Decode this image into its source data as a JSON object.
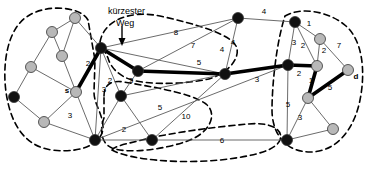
{
  "diagram": {
    "annotation": {
      "line1": "kürzester",
      "line2": "Weg",
      "x": 108,
      "y": 14
    },
    "colors": {
      "node_dark": "#111111",
      "node_light": "#b8b8b8",
      "edge": "#5a5a5a",
      "path": "#000000",
      "cluster": "#000000",
      "background": "#ffffff"
    },
    "nodes": [
      {
        "id": "n1",
        "x": 75,
        "y": 18,
        "fill": "light",
        "r": 5.5,
        "label": ""
      },
      {
        "id": "n2",
        "x": 52,
        "y": 32,
        "fill": "light",
        "r": 5.5,
        "label": ""
      },
      {
        "id": "n3",
        "x": 62,
        "y": 56,
        "fill": "light",
        "r": 5.5,
        "label": ""
      },
      {
        "id": "n4",
        "x": 31,
        "y": 67,
        "fill": "light",
        "r": 5.5,
        "label": ""
      },
      {
        "id": "n5",
        "x": 14,
        "y": 97,
        "fill": "dark",
        "r": 5.5,
        "label": ""
      },
      {
        "id": "n6",
        "x": 44,
        "y": 122,
        "fill": "light",
        "r": 5.5,
        "label": ""
      },
      {
        "id": "s",
        "x": 76,
        "y": 92,
        "fill": "light",
        "r": 5.5,
        "label": "s",
        "label_dx": -9,
        "label_dy": 1
      },
      {
        "id": "n8",
        "x": 101,
        "y": 48,
        "fill": "dark",
        "r": 5.5,
        "label": ""
      },
      {
        "id": "n9",
        "x": 95,
        "y": 140,
        "fill": "dark",
        "r": 5.5,
        "label": ""
      },
      {
        "id": "n10",
        "x": 138,
        "y": 71,
        "fill": "dark",
        "r": 5.5,
        "label": ""
      },
      {
        "id": "n11",
        "x": 121,
        "y": 96,
        "fill": "dark",
        "r": 5.5,
        "label": ""
      },
      {
        "id": "n12",
        "x": 152,
        "y": 140,
        "fill": "dark",
        "r": 5.5,
        "label": ""
      },
      {
        "id": "n13",
        "x": 238,
        "y": 18,
        "fill": "dark",
        "r": 5.5,
        "label": ""
      },
      {
        "id": "n14",
        "x": 225,
        "y": 74,
        "fill": "dark",
        "r": 5.5,
        "label": ""
      },
      {
        "id": "n15",
        "x": 288,
        "y": 65,
        "fill": "dark",
        "r": 5.5,
        "label": ""
      },
      {
        "id": "n16",
        "x": 295,
        "y": 22,
        "fill": "dark",
        "r": 5.5,
        "label": ""
      },
      {
        "id": "n17",
        "x": 320,
        "y": 39,
        "fill": "light",
        "r": 5.5,
        "label": ""
      },
      {
        "id": "n18",
        "x": 317,
        "y": 66,
        "fill": "light",
        "r": 5.5,
        "label": ""
      },
      {
        "id": "n19",
        "x": 348,
        "y": 70,
        "fill": "light",
        "r": 5.5,
        "label": "d",
        "label_dx": 8,
        "label_dy": 9
      },
      {
        "id": "n20",
        "x": 308,
        "y": 98,
        "fill": "light",
        "r": 5.5,
        "label": ""
      },
      {
        "id": "n21",
        "x": 333,
        "y": 129,
        "fill": "light",
        "r": 5.5,
        "label": ""
      },
      {
        "id": "n22",
        "x": 287,
        "y": 140,
        "fill": "dark",
        "r": 5.5,
        "label": ""
      }
    ],
    "edges": [
      {
        "from": "n1",
        "to": "n2",
        "w": "",
        "path": false
      },
      {
        "from": "n1",
        "to": "n3",
        "w": "",
        "path": false
      },
      {
        "from": "n1",
        "to": "n8",
        "w": "",
        "path": false
      },
      {
        "from": "n2",
        "to": "n3",
        "w": "",
        "path": false
      },
      {
        "from": "n2",
        "to": "n4",
        "w": "",
        "path": false
      },
      {
        "from": "n3",
        "to": "s",
        "w": "",
        "path": false
      },
      {
        "from": "n4",
        "to": "n5",
        "w": "",
        "path": false
      },
      {
        "from": "n4",
        "to": "s",
        "w": "",
        "path": false
      },
      {
        "from": "n5",
        "to": "n6",
        "w": "",
        "path": false
      },
      {
        "from": "n6",
        "to": "s",
        "w": "",
        "path": false
      },
      {
        "from": "n6",
        "to": "n9",
        "w": "",
        "path": false
      },
      {
        "from": "s",
        "to": "n8",
        "w": "2",
        "wx": 88,
        "wy": 66,
        "path": true
      },
      {
        "from": "s",
        "to": "n9",
        "w": "3",
        "wx": 70,
        "wy": 118,
        "path": false
      },
      {
        "from": "n8",
        "to": "n9",
        "w": "3",
        "wx": 104,
        "wy": 92,
        "path": false
      },
      {
        "from": "n8",
        "to": "n10",
        "w": "",
        "path": true
      },
      {
        "from": "n8",
        "to": "n11",
        "w": "2",
        "wx": 110,
        "wy": 83,
        "path": false
      },
      {
        "from": "n8",
        "to": "n13",
        "w": "8",
        "wx": 176,
        "wy": 35,
        "path": false
      },
      {
        "from": "n8",
        "to": "n14",
        "w": "7",
        "wx": 193,
        "wy": 48,
        "path": false
      },
      {
        "from": "n9",
        "to": "n11",
        "w": "",
        "path": false
      },
      {
        "from": "n9",
        "to": "n12",
        "w": "2",
        "wx": 124,
        "wy": 132,
        "path": false
      },
      {
        "from": "n9",
        "to": "n15",
        "w": "",
        "path": false
      },
      {
        "from": "n10",
        "to": "n11",
        "w": "3",
        "wx": 131,
        "wy": 83,
        "path": false
      },
      {
        "from": "n10",
        "to": "n13",
        "w": "4",
        "wx": 222,
        "wy": 52,
        "path": false
      },
      {
        "from": "n10",
        "to": "n14",
        "w": "5",
        "wx": 199,
        "wy": 65,
        "path": true
      },
      {
        "from": "n11",
        "to": "n14",
        "w": "",
        "path": false
      },
      {
        "from": "n12",
        "to": "n14",
        "w": "5",
        "wx": 160,
        "wy": 110,
        "path": false
      },
      {
        "from": "n12",
        "to": "n22",
        "w": "6",
        "wx": 222,
        "wy": 143,
        "path": false
      },
      {
        "from": "n11",
        "to": "n12",
        "w": "10",
        "wx": 186,
        "wy": 119,
        "path": false
      },
      {
        "from": "n13",
        "to": "n16",
        "w": "4",
        "wx": 264,
        "wy": 14,
        "path": false
      },
      {
        "from": "n13",
        "to": "n14",
        "w": "4",
        "wx": 233,
        "wy": 45,
        "path": false
      },
      {
        "from": "n14",
        "to": "n15",
        "w": "3",
        "wx": 257,
        "wy": 82,
        "path": true
      },
      {
        "from": "n15",
        "to": "n16",
        "w": "3",
        "wx": 294,
        "wy": 45,
        "path": false
      },
      {
        "from": "n15",
        "to": "n18",
        "w": "2",
        "wx": 299,
        "wy": 76,
        "path": true
      },
      {
        "from": "n15",
        "to": "n22",
        "w": "5",
        "wx": 288,
        "wy": 107,
        "path": false
      },
      {
        "from": "n16",
        "to": "n17",
        "w": "1",
        "wx": 309,
        "wy": 26,
        "path": false
      },
      {
        "from": "n16",
        "to": "n18",
        "w": "2",
        "wx": 303,
        "wy": 48,
        "path": false
      },
      {
        "from": "n17",
        "to": "n18",
        "w": "2",
        "wx": 324,
        "wy": 53,
        "path": false
      },
      {
        "from": "n17",
        "to": "n19",
        "w": "7",
        "wx": 339,
        "wy": 48,
        "path": false
      },
      {
        "from": "n18",
        "to": "n20",
        "w": "1",
        "wx": 311,
        "wy": 83,
        "path": true
      },
      {
        "from": "n19",
        "to": "n20",
        "w": "5",
        "wx": 330,
        "wy": 90,
        "path": true
      },
      {
        "from": "n20",
        "to": "n21",
        "w": "",
        "path": false
      },
      {
        "from": "n20",
        "to": "n22",
        "w": "3",
        "wx": 300,
        "wy": 120,
        "path": false
      },
      {
        "from": "n21",
        "to": "n22",
        "w": "",
        "path": false
      }
    ],
    "clusters": [
      {
        "id": "cluster-left",
        "d": "M 88,20 C 80,6 46,4 28,16 C 8,28 2,62 6,92 C 10,120 22,146 52,150 C 84,154 104,142 103,126 C 102,112 94,104 94,92 L 95,60 Z"
      },
      {
        "id": "cluster-center-top",
        "d": "M 100,42 C 104,20 130,10 160,16 C 196,24 230,34 236,46 C 242,58 226,76 204,80 C 176,85 146,84 132,80 C 118,76 110,66 108,58 Z"
      },
      {
        "id": "cluster-mid-lower",
        "d": "M 104,96 C 104,84 112,80 124,82 C 146,86 190,92 206,104 C 218,114 210,132 190,140 C 164,150 128,154 112,148 C 100,143 100,128 104,118 Z"
      },
      {
        "id": "cluster-bottom",
        "d": "M 112,150 C 130,160 180,164 220,160 C 256,156 276,150 280,140 C 284,128 268,122 248,124 C 214,127 170,133 146,139 C 126,144 114,146 112,150 Z"
      },
      {
        "id": "cluster-right",
        "d": "M 285,16 C 302,6 330,12 346,26 C 362,40 366,70 360,100 C 354,130 336,152 310,152 C 286,152 272,134 272,110 C 272,86 276,44 285,16 Z"
      }
    ]
  }
}
